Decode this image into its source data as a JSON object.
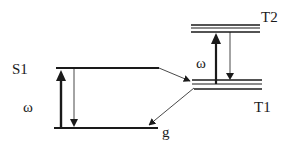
{
  "diagram": {
    "type": "energy-level (Jablonski) diagram",
    "levels": {
      "S1": {
        "label": "S1"
      },
      "g": {
        "label": "g"
      },
      "T1": {
        "label": "T1"
      },
      "T2": {
        "label": "T2"
      }
    },
    "transitions": {
      "singlet_absorption": {
        "label": "ω"
      },
      "triplet_absorption": {
        "label": "ω"
      }
    },
    "colors": {
      "ink": "#1a1a1a",
      "background": "#ffffff"
    }
  }
}
